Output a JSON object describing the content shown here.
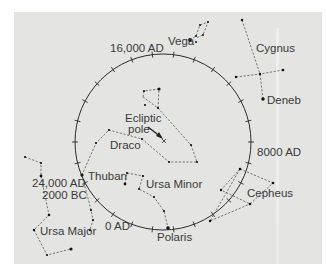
{
  "figure": {
    "background_color": "#e4e4e2",
    "line_color": "#2b2b2b",
    "star_color": "#111111"
  },
  "circle": {
    "center": [
      163,
      142
    ],
    "radius": 88,
    "tick_count": 26,
    "epoch_labels": [
      {
        "text": "16,000 AD",
        "x": 110,
        "y": 51
      },
      {
        "text": "8000 AD",
        "x": 257,
        "y": 155
      },
      {
        "text": "0 AD",
        "x": 105,
        "y": 229
      },
      {
        "text": "24,000 AD",
        "x": 32,
        "y": 186
      },
      {
        "text": "2000 BC",
        "x": 42,
        "y": 198
      }
    ]
  },
  "labels": {
    "ecliptic_pole_line1": "Ecliptic",
    "ecliptic_pole_line2": "pole",
    "vega": "Vega",
    "cygnus": "Cygnus",
    "deneb": "Deneb",
    "draco": "Draco",
    "thuban": "Thuban",
    "ursa_minor": "Ursa Minor",
    "ursa_major": "Ursa Major",
    "polaris": "Polaris",
    "cepheus": "Cepheus",
    "epoch_16000": "16,000 AD",
    "epoch_8000": "8000 AD",
    "epoch_0": "0 AD",
    "epoch_24000": "24,000 AD",
    "epoch_2000bc": "2000 BC"
  },
  "constellations": [
    {
      "name": "Vega (Lyra)",
      "lines": [
        [
          [
            190,
            40
          ],
          [
            196,
            36
          ],
          [
            200,
            25
          ],
          [
            208,
            22
          ],
          [
            203,
            35
          ],
          [
            196,
            38
          ]
        ]
      ]
    },
    {
      "name": "Cygnus",
      "lines": [
        [
          [
            242,
            20
          ],
          [
            260,
            74
          ],
          [
            263,
            99
          ]
        ],
        [
          [
            236,
            77
          ],
          [
            260,
            74
          ],
          [
            283,
            70
          ]
        ]
      ]
    },
    {
      "name": "Draco",
      "lines": [
        [
          [
            144,
            92
          ],
          [
            159,
            92
          ],
          [
            158,
            108
          ],
          [
            143,
            97
          ]
        ],
        [
          [
            158,
            108
          ],
          [
            191,
            144
          ],
          [
            197,
            162
          ],
          [
            169,
            162
          ],
          [
            142,
            139
          ],
          [
            109,
            130
          ],
          [
            96,
            143
          ],
          [
            82,
            175
          ]
        ]
      ]
    },
    {
      "name": "Ursa Minor",
      "lines": [
        [
          [
            125,
            184
          ],
          [
            127,
            173
          ],
          [
            143,
            176
          ],
          [
            139,
            189
          ],
          [
            154,
            197
          ],
          [
            164,
            211
          ],
          [
            168,
            228
          ]
        ]
      ]
    },
    {
      "name": "Ursa Major",
      "lines": [
        [
          [
            25,
            157
          ],
          [
            41,
            163
          ],
          [
            41,
            176
          ],
          [
            49,
            215
          ],
          [
            34,
            230
          ],
          [
            47,
            255
          ],
          [
            71,
            249
          ]
        ],
        [
          [
            34,
            230
          ],
          [
            49,
            215
          ]
        ],
        [
          [
            82,
            175
          ],
          [
            91,
            210
          ],
          [
            93,
            220
          ],
          [
            90,
            230
          ]
        ]
      ]
    },
    {
      "name": "Cepheus",
      "lines": [
        [
          [
            240,
            169
          ],
          [
            273,
            183
          ],
          [
            250,
            204
          ],
          [
            221,
            190
          ],
          [
            240,
            169
          ]
        ],
        [
          [
            240,
            169
          ],
          [
            210,
            221
          ],
          [
            250,
            204
          ]
        ]
      ]
    }
  ]
}
